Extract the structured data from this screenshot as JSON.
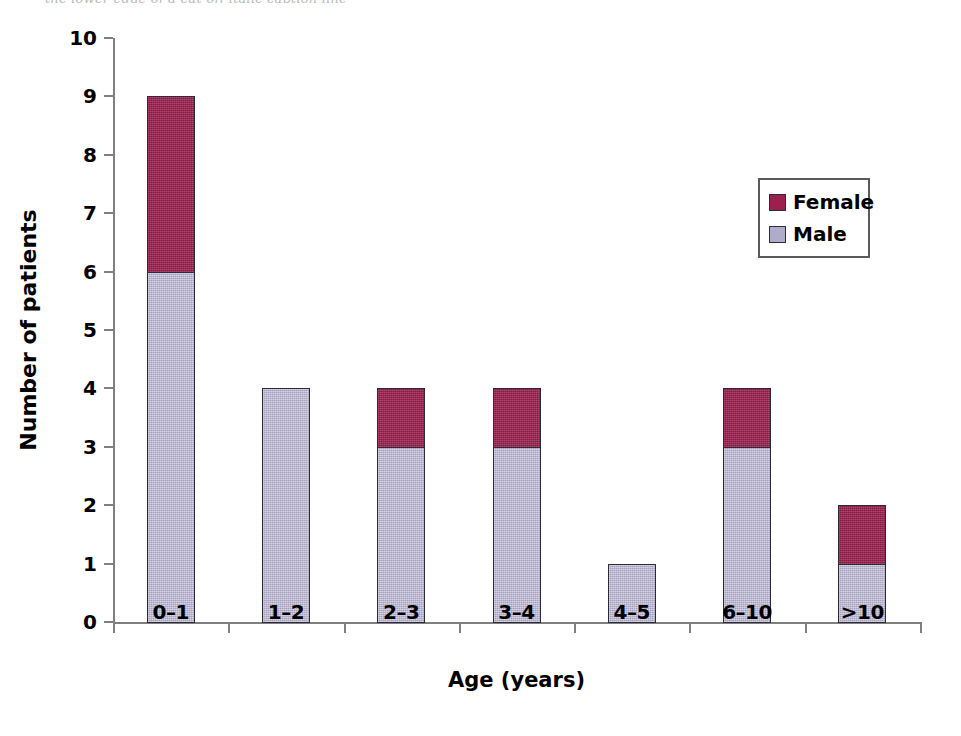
{
  "figure": {
    "background": "#ffffff",
    "top_caption_sliver": "the lower edge of a cut-off italic caption line"
  },
  "chart_data": {
    "type": "bar",
    "subtype": "stacked-vertical",
    "title": "",
    "subtitle": "",
    "xlabel": "Age (years)",
    "ylabel": "Number of patients",
    "categories": [
      "0–1",
      "1–2",
      "2–3",
      "3–4",
      "4–5",
      "6–10",
      ">10"
    ],
    "series": [
      {
        "name": "Male",
        "color": "#afabca",
        "values": [
          6,
          4,
          3,
          3,
          1,
          3,
          1
        ]
      },
      {
        "name": "Female",
        "color": "#9c1f4e",
        "values": [
          3,
          0,
          1,
          1,
          0,
          1,
          1
        ]
      }
    ],
    "stack_order": [
      "Male",
      "Female"
    ],
    "totals": [
      9,
      4,
      4,
      4,
      1,
      4,
      2
    ],
    "ylim": [
      0,
      10
    ],
    "ytick_values": [
      0,
      1,
      2,
      3,
      4,
      5,
      6,
      7,
      8,
      9,
      10
    ],
    "ytick_labels": [
      "0",
      "1",
      "2",
      "3",
      "4",
      "5",
      "6",
      "7",
      "8",
      "9",
      "10"
    ],
    "grid": false,
    "legend_position": "upper right",
    "legend_entries": [
      {
        "label": "Female",
        "color": "#9c1f4e"
      },
      {
        "label": "Male",
        "color": "#afabca"
      }
    ],
    "axis_color": "#808080",
    "bar_edge_color": "#2b2b3a"
  }
}
